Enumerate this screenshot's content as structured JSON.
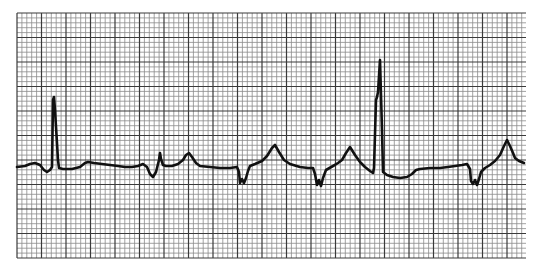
{
  "chart_data": {
    "type": "line",
    "title": "",
    "xlabel": "",
    "ylabel": "",
    "grid": {
      "on": true,
      "x0": 17,
      "y0": 13,
      "x1": 526,
      "y1": 258,
      "minor_spacing_px": 4.9,
      "major_every": 5,
      "minor_color": "#8a8a8a",
      "major_color": "#3a3a3a",
      "paper_color": "#ffffff"
    },
    "trace_color": "#111111",
    "trace_width": 2.6,
    "series": [
      {
        "name": "ECG lead",
        "points": [
          [
            17,
            167
          ],
          [
            25,
            166
          ],
          [
            30,
            164
          ],
          [
            35,
            163
          ],
          [
            40,
            165
          ],
          [
            44,
            170
          ],
          [
            47,
            172
          ],
          [
            50,
            170
          ],
          [
            52,
            167
          ],
          [
            53,
            100
          ],
          [
            54,
            97
          ],
          [
            55,
            110
          ],
          [
            58,
            160
          ],
          [
            59,
            168
          ],
          [
            63,
            169
          ],
          [
            72,
            169
          ],
          [
            80,
            167
          ],
          [
            85,
            163
          ],
          [
            88,
            162
          ],
          [
            94,
            163
          ],
          [
            102,
            164
          ],
          [
            110,
            165
          ],
          [
            118,
            166
          ],
          [
            125,
            167
          ],
          [
            132,
            167
          ],
          [
            138,
            166
          ],
          [
            143,
            164
          ],
          [
            147,
            167
          ],
          [
            150,
            174
          ],
          [
            153,
            177
          ],
          [
            156,
            172
          ],
          [
            159,
            160
          ],
          [
            160,
            153
          ],
          [
            161,
            159
          ],
          [
            163,
            165
          ],
          [
            166,
            166
          ],
          [
            172,
            166
          ],
          [
            178,
            164
          ],
          [
            183,
            160
          ],
          [
            186,
            155
          ],
          [
            189,
            153
          ],
          [
            192,
            157
          ],
          [
            196,
            163
          ],
          [
            200,
            166
          ],
          [
            210,
            167
          ],
          [
            220,
            168
          ],
          [
            230,
            168
          ],
          [
            237,
            167
          ],
          [
            239,
            172
          ],
          [
            240,
            183
          ],
          [
            242,
            179
          ],
          [
            244,
            183
          ],
          [
            246,
            178
          ],
          [
            248,
            171
          ],
          [
            250,
            166
          ],
          [
            255,
            164
          ],
          [
            262,
            161
          ],
          [
            267,
            156
          ],
          [
            272,
            148
          ],
          [
            275,
            145
          ],
          [
            279,
            152
          ],
          [
            284,
            160
          ],
          [
            290,
            164
          ],
          [
            300,
            167
          ],
          [
            308,
            168
          ],
          [
            313,
            168
          ],
          [
            315,
            174
          ],
          [
            317,
            185
          ],
          [
            319,
            180
          ],
          [
            321,
            186
          ],
          [
            323,
            178
          ],
          [
            326,
            170
          ],
          [
            333,
            166
          ],
          [
            338,
            163
          ],
          [
            342,
            160
          ],
          [
            346,
            153
          ],
          [
            350,
            147
          ],
          [
            355,
            155
          ],
          [
            360,
            162
          ],
          [
            365,
            167
          ],
          [
            370,
            171
          ],
          [
            373,
            173
          ],
          [
            374,
            168
          ],
          [
            376,
            100
          ],
          [
            377,
            97
          ],
          [
            378,
            92
          ],
          [
            380,
            60
          ],
          [
            381,
            95
          ],
          [
            382,
            130
          ],
          [
            383,
            172
          ],
          [
            387,
            175
          ],
          [
            393,
            177
          ],
          [
            400,
            178
          ],
          [
            407,
            177
          ],
          [
            412,
            174
          ],
          [
            416,
            170
          ],
          [
            420,
            169
          ],
          [
            430,
            168
          ],
          [
            440,
            168
          ],
          [
            448,
            167
          ],
          [
            455,
            166
          ],
          [
            462,
            165
          ],
          [
            467,
            164
          ],
          [
            470,
            169
          ],
          [
            471,
            181
          ],
          [
            473,
            184
          ],
          [
            475,
            180
          ],
          [
            477,
            185
          ],
          [
            479,
            179
          ],
          [
            481,
            172
          ],
          [
            485,
            168
          ],
          [
            490,
            165
          ],
          [
            495,
            161
          ],
          [
            500,
            155
          ],
          [
            504,
            146
          ],
          [
            507,
            140
          ],
          [
            510,
            146
          ],
          [
            513,
            153
          ],
          [
            515,
            158
          ],
          [
            519,
            161
          ],
          [
            524,
            163
          ]
        ]
      }
    ],
    "annotations": [
      {
        "label": "QRS complex",
        "x": 54,
        "y": 97
      },
      {
        "label": "QRS complex",
        "x": 160,
        "y": 153
      },
      {
        "label": "T wave",
        "x": 189,
        "y": 153
      },
      {
        "label": "T wave",
        "x": 275,
        "y": 145
      },
      {
        "label": "T wave",
        "x": 350,
        "y": 147
      },
      {
        "label": "QRS complex",
        "x": 380,
        "y": 60
      },
      {
        "label": "T wave",
        "x": 507,
        "y": 140
      }
    ]
  }
}
